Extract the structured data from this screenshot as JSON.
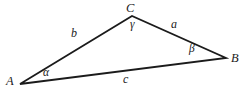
{
  "figure": {
    "type": "triangle-diagram",
    "background_color": "#ffffff",
    "stroke_color": "#1b1b1b",
    "text_color": "#1b1b1b",
    "width": 247,
    "height": 91,
    "vertices": [
      {
        "id": "A",
        "label": "A",
        "x": 20,
        "y": 84,
        "label_x": 6,
        "label_y": 75
      },
      {
        "id": "B",
        "label": "B",
        "x": 226,
        "y": 58,
        "label_x": 231,
        "label_y": 52
      },
      {
        "id": "C",
        "label": "C",
        "x": 132,
        "y": 16,
        "label_x": 126,
        "label_y": 2
      }
    ],
    "sides": [
      {
        "id": "a",
        "label": "a",
        "between": "C-B",
        "label_x": 171,
        "label_y": 18
      },
      {
        "id": "b",
        "label": "b",
        "between": "A-C",
        "label_x": 71,
        "label_y": 27
      },
      {
        "id": "c",
        "label": "c",
        "between": "A-B",
        "label_x": 123,
        "label_y": 73
      }
    ],
    "angles": [
      {
        "id": "alpha",
        "label": "α",
        "at_vertex": "A",
        "label_x": 43,
        "label_y": 67
      },
      {
        "id": "beta",
        "label": "β",
        "at_vertex": "B",
        "label_x": 189,
        "label_y": 43
      },
      {
        "id": "gamma",
        "label": "γ",
        "at_vertex": "C",
        "label_x": 130,
        "label_y": 19
      }
    ],
    "path_points": "20,84 132,16 226,58"
  }
}
